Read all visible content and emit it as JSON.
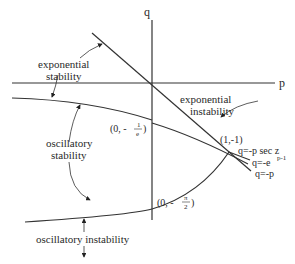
{
  "diagram": {
    "axes": {
      "x_label": "p",
      "y_label": "q"
    },
    "regions": {
      "exp_stability": [
        "exponential",
        "stability"
      ],
      "exp_instability": [
        "exponential",
        "instability"
      ],
      "osc_stability": [
        "oscillatory",
        "stability"
      ],
      "osc_instability": "oscillatory instability"
    },
    "points": {
      "p1_prefix": "(0, -",
      "p1_num": "1",
      "p1_den": "e",
      "p1_suffix": ")",
      "p2_prefix": "(0, -",
      "p2_num": "π",
      "p2_den": "2",
      "p2_suffix": ")",
      "p3": "(1,-1)"
    },
    "curves": {
      "c1": "q=-p sec z",
      "c2_base": "q=-e",
      "c2_exp": "p-1",
      "c3": "q=-p"
    },
    "colors": {
      "line": "#333333",
      "text": "#2a2a2a",
      "background": "#ffffff"
    }
  }
}
